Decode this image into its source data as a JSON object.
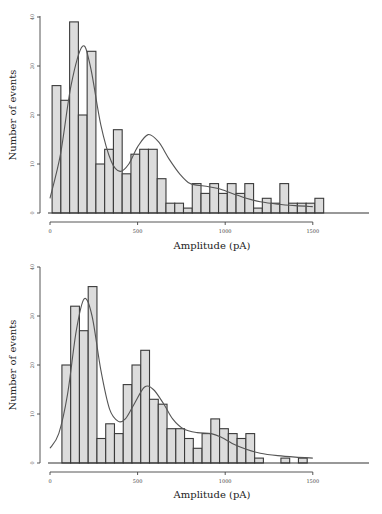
{
  "chart_data": [
    {
      "type": "bar",
      "panel": "top",
      "title": "",
      "xlabel": "Amplitude (pA)",
      "ylabel": "Number of events",
      "xlim": [
        0,
        1800
      ],
      "ylim": [
        0,
        40
      ],
      "xticks": [
        0,
        500,
        1000,
        1500
      ],
      "xtick_labels": [
        "0",
        "500",
        "1000",
        "1500"
      ],
      "yticks": [
        0,
        10,
        20,
        30,
        40
      ],
      "ytick_labels": [
        "0",
        "10",
        "20",
        "30",
        "40"
      ],
      "grid": false,
      "legend": null,
      "bin_width_pA": 50,
      "bin_start_pA": 12,
      "values": [
        26,
        23,
        39,
        20,
        33,
        10,
        13,
        17,
        8,
        12,
        13,
        13,
        7,
        2,
        2,
        1,
        6,
        4,
        6,
        4,
        6,
        4,
        6,
        1,
        3,
        2,
        6,
        2,
        2,
        2,
        3
      ],
      "fit_curve": {
        "name": "sum of gaussians fit",
        "points": [
          [
            0,
            3
          ],
          [
            60,
            12
          ],
          [
            120,
            26
          ],
          [
            185,
            34
          ],
          [
            230,
            30
          ],
          [
            290,
            18
          ],
          [
            350,
            10.5
          ],
          [
            400,
            8.5
          ],
          [
            450,
            10
          ],
          [
            500,
            13.5
          ],
          [
            560,
            16
          ],
          [
            620,
            14.5
          ],
          [
            680,
            11
          ],
          [
            740,
            8
          ],
          [
            800,
            6
          ],
          [
            880,
            5.5
          ],
          [
            960,
            5
          ],
          [
            1040,
            4
          ],
          [
            1120,
            3
          ],
          [
            1200,
            2.3
          ],
          [
            1300,
            1.8
          ],
          [
            1400,
            1.5
          ],
          [
            1500,
            1.3
          ]
        ]
      }
    },
    {
      "type": "bar",
      "panel": "bottom",
      "title": "",
      "xlabel": "Amplitude (pA)",
      "ylabel": "Number of events",
      "xlim": [
        0,
        1800
      ],
      "ylim": [
        0,
        40
      ],
      "xticks": [
        0,
        500,
        1000,
        1500
      ],
      "xtick_labels": [
        "0",
        "500",
        "1000",
        "1500"
      ],
      "yticks": [
        0,
        10,
        20,
        30,
        40
      ],
      "ytick_labels": [
        "0",
        "10",
        "20",
        "30",
        "40"
      ],
      "grid": false,
      "legend": null,
      "bin_width_pA": 50,
      "bin_start_pA": 68,
      "values": [
        20,
        32,
        27,
        36,
        5,
        8,
        6,
        16,
        20,
        23,
        13,
        12,
        7,
        7,
        5,
        3,
        6,
        9,
        7,
        6,
        5,
        6,
        1,
        0,
        0,
        1,
        0,
        1
      ],
      "fit_curve": {
        "name": "sum of gaussians fit",
        "points": [
          [
            0,
            3
          ],
          [
            50,
            6
          ],
          [
            100,
            14
          ],
          [
            150,
            27
          ],
          [
            195,
            33.5
          ],
          [
            240,
            30
          ],
          [
            290,
            19
          ],
          [
            340,
            11
          ],
          [
            390,
            8.5
          ],
          [
            430,
            9
          ],
          [
            480,
            12
          ],
          [
            540,
            15.5
          ],
          [
            590,
            15
          ],
          [
            650,
            12
          ],
          [
            700,
            9
          ],
          [
            760,
            7
          ],
          [
            840,
            6.2
          ],
          [
            920,
            6
          ],
          [
            980,
            5.2
          ],
          [
            1040,
            4
          ],
          [
            1120,
            2.8
          ],
          [
            1200,
            2
          ],
          [
            1300,
            1.5
          ],
          [
            1400,
            1.2
          ],
          [
            1500,
            1
          ]
        ]
      }
    }
  ],
  "panels": {
    "top": {
      "xlabel": "Amplitude (pA)",
      "ylabel": "Number of events"
    },
    "bottom": {
      "xlabel": "Amplitude (pA)",
      "ylabel": "Number of events"
    }
  }
}
